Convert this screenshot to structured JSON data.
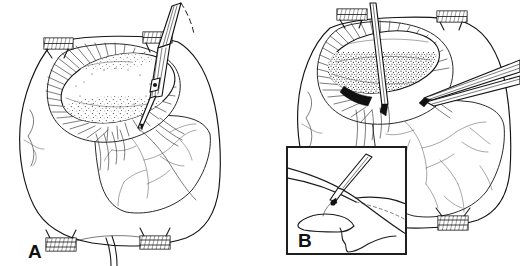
{
  "figure": {
    "background_color": "#ffffff",
    "ink_color": "#141414",
    "width": 520,
    "height": 266,
    "style": "pen-and-ink medical line drawing with cross-hatching and stippling"
  },
  "panels": [
    {
      "id": "A",
      "label": "A",
      "label_position": {
        "x": 30,
        "y": 258
      },
      "description": "Operative field with self-retaining retractor blades, exposed ovoid organ surface with stippled texture and radiating hatched capsule, vascular branches over lower tissue flap, and an electrosurgical pencil entering from upper right.",
      "elements": [
        {
          "name": "retractor-clamp-top-left",
          "kind": "instrument"
        },
        {
          "name": "retractor-clamp-top-right",
          "kind": "instrument"
        },
        {
          "name": "retractor-clamp-bottom-left",
          "kind": "instrument"
        },
        {
          "name": "retractor-clamp-bottom-right",
          "kind": "instrument"
        },
        {
          "name": "exposed-organ-mass",
          "kind": "anatomy"
        },
        {
          "name": "hatched-capsule-margin",
          "kind": "anatomy"
        },
        {
          "name": "vascular-branches",
          "kind": "anatomy"
        },
        {
          "name": "tissue-flap",
          "kind": "anatomy"
        },
        {
          "name": "electrosurgical-pencil",
          "kind": "instrument"
        },
        {
          "name": "suture-strand",
          "kind": "instrument"
        }
      ]
    },
    {
      "id": "B",
      "label": "B",
      "label_position": {
        "x": 300,
        "y": 247
      },
      "description": "Same operative field further in the dissection: organ surface more heavily stippled, a straight probe/knife passes vertically through the field, toothed forceps enter from the right, and a boxed inset magnifies the cautery tip at the dissection plane.",
      "elements": [
        {
          "name": "retractor-clamp-top-left",
          "kind": "instrument"
        },
        {
          "name": "retractor-clamp-top-right",
          "kind": "instrument"
        },
        {
          "name": "retractor-clamp-bottom-right",
          "kind": "instrument"
        },
        {
          "name": "exposed-organ-mass",
          "kind": "anatomy"
        },
        {
          "name": "hatched-capsule-margin",
          "kind": "anatomy"
        },
        {
          "name": "vascular-branches",
          "kind": "anatomy"
        },
        {
          "name": "vertical-probe",
          "kind": "instrument"
        },
        {
          "name": "toothed-forceps",
          "kind": "instrument"
        },
        {
          "name": "inset-detail-box",
          "kind": "callout"
        }
      ],
      "inset": {
        "name": "inset-detail-box",
        "bounds": {
          "x": 287,
          "y": 147,
          "width": 119,
          "height": 107
        },
        "label": "B",
        "description": "Magnified view of the cautery / needle tip incising the tissue plane between two layers, with an irregular lobulated structure below."
      }
    }
  ],
  "labels": {
    "panel_a": "A",
    "panel_b": "B"
  }
}
